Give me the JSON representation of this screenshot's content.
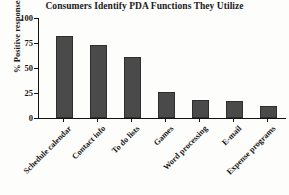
{
  "chart_data": {
    "type": "bar",
    "title": "Consumers Identify PDA Functions They Utilize",
    "xlabel": "",
    "ylabel": "% Positive responses",
    "categories": [
      "Schedule calendar",
      "Contact info",
      "To do lists",
      "Games",
      "Word processing",
      "E-mail",
      "Expense programs"
    ],
    "values": [
      82,
      73,
      61,
      26,
      18,
      17,
      12
    ],
    "ylim": [
      0,
      100
    ],
    "yticks": [
      0,
      25,
      50,
      75,
      100
    ],
    "ytick_labels": [
      "0",
      "25",
      "50",
      "75",
      "100"
    ],
    "grid": false,
    "legend": false,
    "bar_color": "#4a4a4a",
    "bar_edge_color": "#2e2e2e",
    "axis_color": "#111111",
    "background_color": "#fdfdfb"
  }
}
